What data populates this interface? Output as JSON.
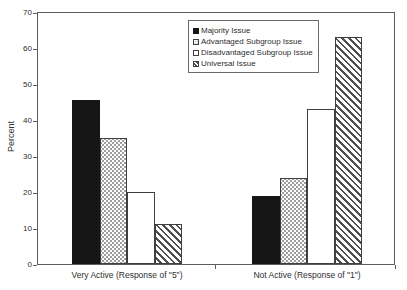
{
  "chart_data": {
    "type": "bar",
    "title": "",
    "xlabel": "",
    "ylabel": "Percent",
    "ylim": [
      0,
      70
    ],
    "yticks": [
      0,
      10,
      20,
      30,
      40,
      50,
      60,
      70
    ],
    "grid": false,
    "legend_position": "top-center-inside",
    "categories": [
      "Very Active (Response of \"5\")",
      "Not Active (Response of \"1\")"
    ],
    "series": [
      {
        "name": "Majority Issue",
        "pattern": "solid-black",
        "values": [
          45.5,
          19
        ]
      },
      {
        "name": "Advantaged Subgroup Issue",
        "pattern": "dots",
        "values": [
          35,
          24
        ]
      },
      {
        "name": "Disadvantaged Subgroup Issue",
        "pattern": "white",
        "values": [
          20,
          43
        ]
      },
      {
        "name": "Universal Issue",
        "pattern": "diagonal-hatch",
        "values": [
          11,
          63
        ]
      }
    ],
    "colors": {
      "bar_black": "#161616",
      "line": "#5d5d5d",
      "background": "#ffffff",
      "text": "#2e2e2e"
    }
  }
}
